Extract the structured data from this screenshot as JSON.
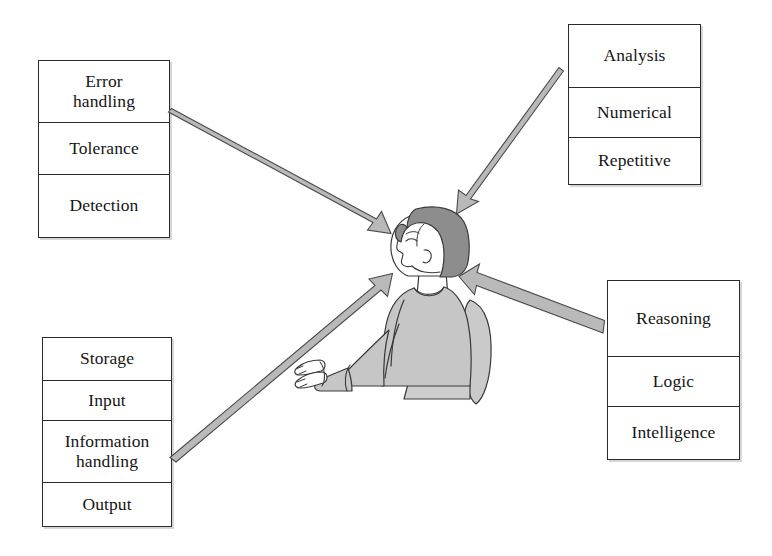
{
  "diagram": {
    "colors": {
      "box_border": "#2b2b2b",
      "box_fill": "#ffffff",
      "arrow_fill": "#b9b9b9",
      "arrow_stroke": "#4a4a4a",
      "hair": "#8d8d8d",
      "garment": "#c6c6c6",
      "skin": "#ffffff",
      "outline": "#3a3a3a",
      "text": "#151515"
    },
    "boxes": [
      {
        "id": "error-handling",
        "position": "top-left",
        "rows": [
          {
            "line1": "Error",
            "line2": "handling"
          },
          {
            "line1": "Tolerance",
            "line2": ""
          },
          {
            "line1": "Detection",
            "line2": ""
          }
        ]
      },
      {
        "id": "analysis",
        "position": "top-right",
        "rows": [
          {
            "line1": "Analysis",
            "line2": ""
          },
          {
            "line1": "Numerical",
            "line2": ""
          },
          {
            "line1": "Repetitive",
            "line2": ""
          }
        ]
      },
      {
        "id": "information",
        "position": "bottom-left",
        "rows": [
          {
            "line1": "Storage",
            "line2": ""
          },
          {
            "line1": "Input",
            "line2": ""
          },
          {
            "line1": "Information",
            "line2": "handling"
          },
          {
            "line1": "Output",
            "line2": ""
          }
        ]
      },
      {
        "id": "reasoning",
        "position": "bottom-right",
        "rows": [
          {
            "line1": "Reasoning",
            "line2": ""
          },
          {
            "line1": "Logic",
            "line2": ""
          },
          {
            "line1": "Intelligence",
            "line2": ""
          }
        ]
      }
    ],
    "arrows": [
      {
        "id": "arrow-from-error-handling",
        "from": "top-left",
        "to": "center",
        "direction": "down-right"
      },
      {
        "id": "arrow-from-analysis",
        "from": "top-right",
        "to": "center",
        "direction": "down-left"
      },
      {
        "id": "arrow-from-information",
        "from": "bottom-left",
        "to": "center",
        "direction": "up-right"
      },
      {
        "id": "arrow-from-reasoning",
        "from": "bottom-right",
        "to": "center",
        "direction": "up-left"
      }
    ],
    "center_figure": {
      "id": "seated-person",
      "description": "Seated person shown in left-facing profile with bobbed hair, hands extended forward"
    }
  }
}
